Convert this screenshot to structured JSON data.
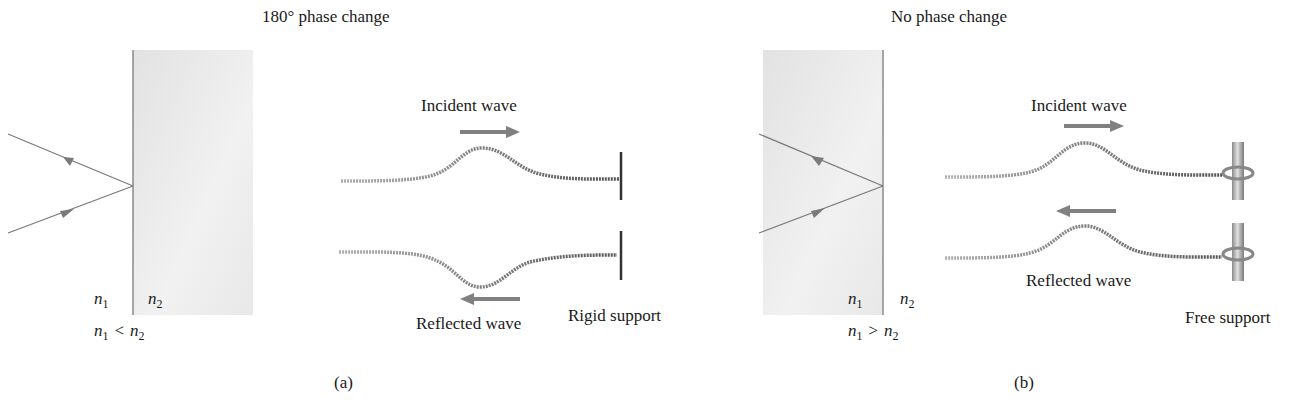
{
  "panel_a": {
    "title": "180° phase change",
    "caption": "(a)",
    "medium_left": {
      "symbol": "n",
      "subscript": "1"
    },
    "medium_right": {
      "symbol": "n",
      "subscript": "2"
    },
    "relation": {
      "left": "n",
      "left_sub": "1",
      "op": "<",
      "right": "n",
      "right_sub": "2"
    },
    "incident_label": "Incident wave",
    "reflected_label": "Reflected wave",
    "support_label": "Rigid support"
  },
  "panel_b": {
    "title": "No phase change",
    "caption": "(b)",
    "medium_left": {
      "symbol": "n",
      "subscript": "1"
    },
    "medium_right": {
      "symbol": "n",
      "subscript": "2"
    },
    "relation": {
      "left": "n",
      "left_sub": "1",
      "op": ">",
      "right": "n",
      "right_sub": "2"
    },
    "incident_label": "Incident wave",
    "reflected_label": "Reflected wave",
    "support_label": "Free support"
  },
  "colors": {
    "medium_fill": "#e6e6e6",
    "ray": "#7a7a7a",
    "arrow": "#808080",
    "rope": "#8a8a8a",
    "text": "#1a1a1a"
  }
}
